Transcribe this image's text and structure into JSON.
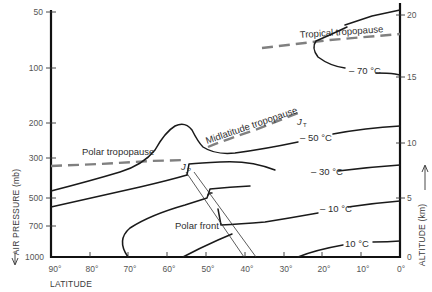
{
  "figure": {
    "type": "atmospheric cross-section diagram",
    "left_axis": {
      "title": "AIR PRESSURE (mb)",
      "arrow": "down",
      "ticks": [
        {
          "label": "50",
          "y": 12
        },
        {
          "label": "100",
          "y": 68
        },
        {
          "label": "200",
          "y": 123
        },
        {
          "label": "300",
          "y": 158
        },
        {
          "label": "500",
          "y": 198
        },
        {
          "label": "700",
          "y": 226
        },
        {
          "label": "1000",
          "y": 257
        }
      ]
    },
    "right_axis": {
      "title": "ALTITUDE (km)",
      "arrow": "up",
      "ticks": [
        {
          "label": "20",
          "y": 15
        },
        {
          "label": "15",
          "y": 77
        },
        {
          "label": "10",
          "y": 143
        },
        {
          "label": "5",
          "y": 198
        },
        {
          "label": "0",
          "y": 257
        }
      ]
    },
    "bottom_axis": {
      "title": "LATITUDE",
      "ticks": [
        {
          "label": "90°",
          "x": 51
        },
        {
          "label": "80°",
          "x": 90
        },
        {
          "label": "70°",
          "x": 128
        },
        {
          "label": "60°",
          "x": 167
        },
        {
          "label": "50°",
          "x": 206
        },
        {
          "label": "40°",
          "x": 245
        },
        {
          "label": "30°",
          "x": 284
        },
        {
          "label": "20°",
          "x": 322
        },
        {
          "label": "10°",
          "x": 361
        },
        {
          "label": "0°",
          "x": 400
        }
      ]
    },
    "tropopauses": [
      {
        "name": "Polar tropopause",
        "label": "Polar tropopause"
      },
      {
        "name": "Midlatitude tropopause",
        "label": "Midlatitude tropopause"
      },
      {
        "name": "Tropical tropopause",
        "label": "Tropical tropopause"
      }
    ],
    "isotherms": [
      {
        "label": "– 70 °C"
      },
      {
        "label": "– 50 °C"
      },
      {
        "label": "– 30 °C"
      },
      {
        "label": "– 10 °C"
      },
      {
        "label": "10 °C"
      }
    ],
    "jet_streams": [
      {
        "label": "J",
        "subscript": "P",
        "name": "polar jet"
      },
      {
        "label": "J",
        "subscript": "T",
        "name": "subtropical jet"
      }
    ],
    "front": {
      "label": "Polar front"
    },
    "colors": {
      "isotherm": "#1a1a1a",
      "tropopause": "#808080",
      "axis": "#111111",
      "text": "#3a3a3a"
    }
  }
}
